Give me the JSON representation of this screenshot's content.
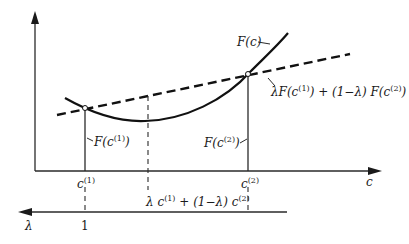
{
  "diagram": {
    "labels": {
      "curve": {
        "main": "F(c)"
      },
      "chord": {
        "prefix": "λF(c",
        "sup1": "(1)",
        "mid": ") + (1−λ) F(c",
        "sup2": "(2)",
        "suffix": ")"
      },
      "f_c1": {
        "main": "F(c",
        "sup": "(1)",
        "suffix": ")"
      },
      "f_c2": {
        "main": "F(c",
        "sup": "(2)",
        "suffix": ")"
      },
      "c1": {
        "main": "c",
        "sup": "(1)"
      },
      "c2": {
        "main": "c",
        "sup": "(2)"
      },
      "c_axis": "c",
      "mix": {
        "prefix": "λ c",
        "sup1": "(1)",
        "mid": " + (1−λ) c",
        "sup2": "(2)"
      },
      "lambda_axis": "λ",
      "lambda_one": "1"
    },
    "points": {
      "c1": {
        "lambda": 1
      },
      "c2": {
        "lambda": 0
      }
    }
  }
}
